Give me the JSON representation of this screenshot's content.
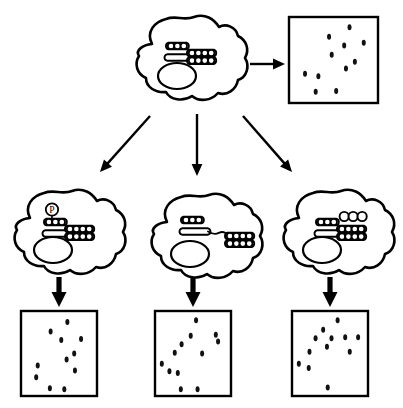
{
  "figure": {
    "background_color": "#ffffff",
    "stroke_color": "#000000",
    "dot_color": "#111111",
    "width": 403,
    "height": 408
  },
  "cells": [
    {
      "id": "parent-cell",
      "role": "parent",
      "label": "",
      "outline": "M 152 44 C 146 32 154 22 166 19 C 176 15 184 21 194 17 C 205 13 214 19 219 27 C 226 23 236 27 238 36 C 246 40 250 49 245 58 C 250 66 247 77 238 80 C 236 90 227 96 218 93 C 211 101 199 102 192 96 C 183 102 170 100 166 92 C 155 93 146 87 146 78 C 137 74 134 64 139 56 C 135 50 143 45 152 44 Z",
      "nucleus": {
        "cx": 177,
        "cy": 76,
        "rx": 19,
        "ry": 13
      },
      "glycan": {
        "variant": "reference",
        "top_row_beads": 3,
        "grid_beads_cols": 4,
        "grid_beads_rows": 2,
        "has_phosphate": false,
        "has_open_circles": false,
        "stretched": false
      }
    },
    {
      "id": "variant-cell-phosphate",
      "role": "variant",
      "label": "",
      "outline": "M 30 218 C 24 206 32 196 44 193 C 54 189 62 195 72 191 C 83 187 92 193 97 201 C 104 197 114 201 116 210 C 124 214 128 223 123 232 C 128 240 125 251 116 254 C 114 264 105 270 96 267 C 89 275 77 276 70 270 C 61 276 48 274 44 266 C 33 267 24 261 24 252 C 15 248 12 238 17 230 C 13 224 21 219 30 218 Z",
      "nucleus": {
        "cx": 53,
        "cy": 250,
        "rx": 19,
        "ry": 13
      },
      "glycan": {
        "variant": "phosphorylated",
        "top_row_beads": 3,
        "grid_beads_cols": 4,
        "grid_beads_rows": 2,
        "has_phosphate": true,
        "phosphate_symbol": "P",
        "has_open_circles": false,
        "stretched": false
      }
    },
    {
      "id": "variant-cell-stretched",
      "role": "variant",
      "label": "",
      "outline": "M 167 222 C 161 210 169 200 181 197 C 191 193 199 199 209 195 C 220 191 229 197 234 205 C 241 201 251 205 253 214 C 261 218 265 227 260 236 C 265 244 262 255 253 258 C 251 268 242 274 233 271 C 226 279 214 280 207 274 C 198 280 185 278 181 270 C 170 271 161 265 161 256 C 152 252 149 242 154 234 C 150 228 158 223 167 222 Z",
      "nucleus": {
        "cx": 190,
        "cy": 254,
        "rx": 19,
        "ry": 13
      },
      "glycan": {
        "variant": "elongated-linker",
        "top_row_beads": 3,
        "grid_beads_cols": 4,
        "grid_beads_rows": 2,
        "has_phosphate": false,
        "has_open_circles": false,
        "stretched": true
      }
    },
    {
      "id": "variant-cell-extended",
      "role": "variant",
      "label": "",
      "outline": "M 299 218 C 293 206 301 196 313 193 C 323 189 331 195 341 191 C 352 187 361 193 366 201 C 373 197 383 201 385 210 C 393 214 397 223 392 232 C 397 240 394 251 385 254 C 383 264 374 270 365 267 C 358 275 346 276 339 270 C 330 276 317 274 313 266 C 302 267 293 261 293 252 C 284 248 281 238 286 230 C 282 224 290 219 299 218 Z",
      "nucleus": {
        "cx": 322,
        "cy": 250,
        "rx": 19,
        "ry": 13
      },
      "glycan": {
        "variant": "extended-residues",
        "top_row_beads": 3,
        "grid_beads_cols": 4,
        "grid_beads_rows": 2,
        "has_phosphate": false,
        "has_open_circles": true,
        "open_circle_count": 3,
        "stretched": false
      }
    }
  ],
  "result_boxes": [
    {
      "id": "result-box-parent",
      "x": 289,
      "y": 17,
      "width": 89,
      "height": 86,
      "dot_count": 11,
      "dots": [
        {
          "x": 0.68,
          "y": 0.12
        },
        {
          "x": 0.45,
          "y": 0.23
        },
        {
          "x": 0.62,
          "y": 0.33
        },
        {
          "x": 0.84,
          "y": 0.3
        },
        {
          "x": 0.48,
          "y": 0.44
        },
        {
          "x": 0.74,
          "y": 0.52
        },
        {
          "x": 0.64,
          "y": 0.6
        },
        {
          "x": 0.18,
          "y": 0.66
        },
        {
          "x": 0.33,
          "y": 0.69
        },
        {
          "x": 0.3,
          "y": 0.87
        },
        {
          "x": 0.53,
          "y": 0.86
        }
      ]
    },
    {
      "id": "result-box-phosphate",
      "x": 21,
      "y": 311,
      "width": 76,
      "height": 85,
      "dot_count": 11,
      "dots": [
        {
          "x": 0.61,
          "y": 0.13
        },
        {
          "x": 0.39,
          "y": 0.24
        },
        {
          "x": 0.53,
          "y": 0.34
        },
        {
          "x": 0.79,
          "y": 0.33
        },
        {
          "x": 0.7,
          "y": 0.5
        },
        {
          "x": 0.6,
          "y": 0.57
        },
        {
          "x": 0.22,
          "y": 0.64
        },
        {
          "x": 0.2,
          "y": 0.78
        },
        {
          "x": 0.71,
          "y": 0.7
        },
        {
          "x": 0.38,
          "y": 0.91
        },
        {
          "x": 0.57,
          "y": 0.92
        }
      ]
    },
    {
      "id": "result-box-stretched",
      "x": 155,
      "y": 311,
      "width": 76,
      "height": 85,
      "dot_count": 12,
      "dots": [
        {
          "x": 0.54,
          "y": 0.11
        },
        {
          "x": 0.47,
          "y": 0.29
        },
        {
          "x": 0.8,
          "y": 0.28
        },
        {
          "x": 0.83,
          "y": 0.36
        },
        {
          "x": 0.35,
          "y": 0.39
        },
        {
          "x": 0.26,
          "y": 0.49
        },
        {
          "x": 0.62,
          "y": 0.5
        },
        {
          "x": 0.09,
          "y": 0.62
        },
        {
          "x": 0.19,
          "y": 0.71
        },
        {
          "x": 0.3,
          "y": 0.73
        },
        {
          "x": 0.34,
          "y": 0.92
        },
        {
          "x": 0.56,
          "y": 0.92
        }
      ]
    },
    {
      "id": "result-box-extended",
      "x": 292,
      "y": 311,
      "width": 76,
      "height": 85,
      "dot_count": 12,
      "dots": [
        {
          "x": 0.6,
          "y": 0.11
        },
        {
          "x": 0.41,
          "y": 0.22
        },
        {
          "x": 0.52,
          "y": 0.32
        },
        {
          "x": 0.7,
          "y": 0.31
        },
        {
          "x": 0.31,
          "y": 0.32
        },
        {
          "x": 0.87,
          "y": 0.31
        },
        {
          "x": 0.46,
          "y": 0.42
        },
        {
          "x": 0.23,
          "y": 0.48
        },
        {
          "x": 0.76,
          "y": 0.48
        },
        {
          "x": 0.09,
          "y": 0.62
        },
        {
          "x": 0.22,
          "y": 0.67
        },
        {
          "x": 0.47,
          "y": 0.9
        }
      ]
    }
  ],
  "arrows": [
    {
      "id": "arrow-parent-to-result",
      "direction": "right",
      "style": "thin"
    },
    {
      "id": "arrow-parent-to-left-variant",
      "direction": "down-left",
      "style": "thin"
    },
    {
      "id": "arrow-parent-to-middle-variant",
      "direction": "down",
      "style": "thin"
    },
    {
      "id": "arrow-parent-to-right-variant",
      "direction": "down-right",
      "style": "thin"
    },
    {
      "id": "arrow-left-variant-to-box",
      "direction": "down",
      "style": "thick"
    },
    {
      "id": "arrow-middle-variant-to-box",
      "direction": "down",
      "style": "thick"
    },
    {
      "id": "arrow-right-variant-to-box",
      "direction": "down",
      "style": "thick"
    }
  ]
}
